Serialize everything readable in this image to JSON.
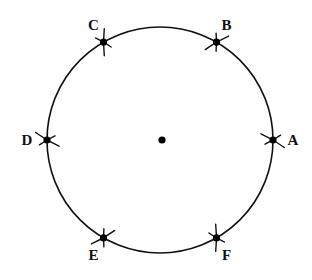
{
  "diagram": {
    "center": {
      "label": ""
    },
    "points": [
      {
        "id": "A",
        "label": "A",
        "angle_deg": 0
      },
      {
        "id": "B",
        "label": "B",
        "angle_deg": 60
      },
      {
        "id": "C",
        "label": "C",
        "angle_deg": 120
      },
      {
        "id": "D",
        "label": "D",
        "angle_deg": 180
      },
      {
        "id": "E",
        "label": "E",
        "angle_deg": 240
      },
      {
        "id": "F",
        "label": "F",
        "angle_deg": 300
      }
    ],
    "colors": {
      "ink": "#111111",
      "background": "#ffffff"
    }
  }
}
